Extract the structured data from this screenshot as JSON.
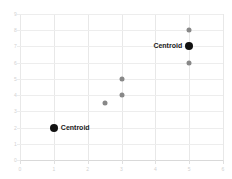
{
  "chart_data": {
    "type": "scatter",
    "title": "",
    "xlabel": "",
    "ylabel": "",
    "xlim": [
      0,
      6
    ],
    "ylim": [
      0,
      9
    ],
    "xticks": [
      0,
      1,
      2,
      3,
      4,
      5,
      6
    ],
    "yticks": [
      0,
      1,
      2,
      3,
      4,
      5,
      6,
      7,
      8,
      9
    ],
    "grid": true,
    "legend": "none",
    "series": [
      {
        "name": "cluster points",
        "marker": "circle",
        "color": "#888888",
        "points": [
          {
            "x": 2.5,
            "y": 3.5
          },
          {
            "x": 3,
            "y": 4
          },
          {
            "x": 3,
            "y": 5
          },
          {
            "x": 5,
            "y": 6
          },
          {
            "x": 5,
            "y": 8
          }
        ]
      },
      {
        "name": "centroids",
        "marker": "circle",
        "color": "#111111",
        "points": [
          {
            "x": 1,
            "y": 2,
            "label": "Centroid",
            "label_side": "right"
          },
          {
            "x": 5,
            "y": 7,
            "label": "Centroid",
            "label_side": "left"
          }
        ]
      }
    ],
    "annotations": [
      {
        "text": "Centroid",
        "x": 1,
        "y": 2,
        "side": "right"
      },
      {
        "text": "Centroid",
        "x": 5,
        "y": 7,
        "side": "left"
      }
    ]
  },
  "colors": {
    "member_point": "#888888",
    "centroid_point": "#111111",
    "gridline": "#e8e8e8",
    "tick_label": "#d2d2d2",
    "background": "#ffffff"
  }
}
